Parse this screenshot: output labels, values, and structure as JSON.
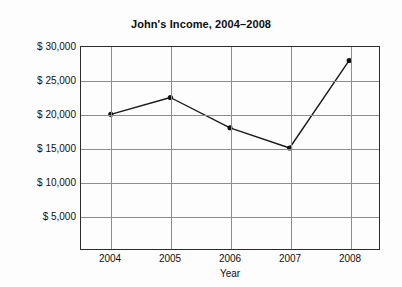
{
  "chart_data": {
    "type": "line",
    "title": "John's Income, 2004–2008",
    "xlabel": "Year",
    "ylabel": "",
    "categories": [
      "2004",
      "2005",
      "2006",
      "2007",
      "2008"
    ],
    "values": [
      20000,
      22500,
      18000,
      15000,
      28000
    ],
    "series": [
      {
        "name": "John's Income",
        "values": [
          20000,
          22500,
          18000,
          15000,
          28000
        ]
      }
    ],
    "ylim": [
      0,
      30000
    ],
    "ytick_values": [
      5000,
      10000,
      15000,
      20000,
      25000,
      30000
    ],
    "ytick_labels": [
      "$ 5,000",
      "$ 10,000",
      "$ 15,000",
      "$ 20,000",
      "$ 25,000",
      "$ 30,000"
    ],
    "xtick_labels": [
      "2004",
      "2005",
      "2006",
      "2007",
      "2008"
    ],
    "grid": true,
    "legend": false,
    "legend_position": "none",
    "marker": "filled-circle",
    "line_color": "#1a1a1a",
    "marker_color": "#111111",
    "grid_color": "#8d8d8d",
    "axis_color": "#2b2b2b",
    "background_color": "#fdfdfd"
  }
}
